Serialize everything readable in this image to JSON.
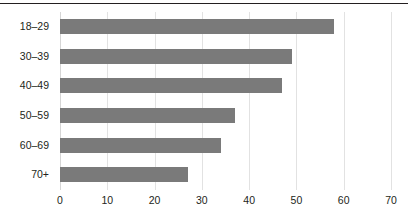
{
  "chart_data": {
    "type": "bar",
    "orientation": "horizontal",
    "title": "",
    "xlabel": "",
    "ylabel": "",
    "categories": [
      "18–29",
      "30–39",
      "40–49",
      "50–59",
      "60–69",
      "70+"
    ],
    "values": [
      58,
      49,
      47,
      37,
      34,
      27
    ],
    "xlim": [
      0,
      70
    ],
    "xticks": [
      0,
      10,
      20,
      30,
      40,
      50,
      60,
      70
    ],
    "xtick_labels": [
      "0",
      "10",
      "20",
      "30",
      "40",
      "50",
      "60",
      "70"
    ],
    "grid": "vertical",
    "legend": "none",
    "series": [
      {
        "name": "",
        "color": "#7a7a7a",
        "values": [
          58,
          49,
          47,
          37,
          34,
          27
        ]
      }
    ]
  },
  "style": {
    "bar_color": "#7a7a7a",
    "grid_color": "#e2e2e2",
    "rule_color": "#231f20",
    "text_color": "#231f20",
    "background": "#ffffff"
  }
}
